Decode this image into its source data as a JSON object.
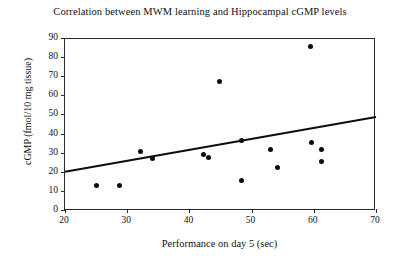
{
  "chart_data": {
    "type": "scatter",
    "title": "Correlation between MWM learning and Hippocampal cGMP levels",
    "xlabel": "Performance on day 5 (sec)",
    "ylabel": "cGMP (fmol/10 mg tissue)",
    "xlim": [
      20,
      70
    ],
    "ylim": [
      0,
      90
    ],
    "xticks": [
      20,
      30,
      40,
      50,
      60,
      70
    ],
    "yticks": [
      0,
      10,
      20,
      30,
      40,
      50,
      60,
      70,
      80,
      90
    ],
    "grid": false,
    "legend": null,
    "marker": "filled-circle",
    "marker_color": "#0d0d0d",
    "points": [
      {
        "x": 25.1,
        "y": 12.6
      },
      {
        "x": 28.8,
        "y": 12.6
      },
      {
        "x": 32.1,
        "y": 30.4
      },
      {
        "x": 34.1,
        "y": 27.2
      },
      {
        "x": 42.3,
        "y": 28.8
      },
      {
        "x": 43.1,
        "y": 27.7
      },
      {
        "x": 44.9,
        "y": 67.0
      },
      {
        "x": 48.3,
        "y": 36.6
      },
      {
        "x": 48.3,
        "y": 15.2
      },
      {
        "x": 53.1,
        "y": 31.4
      },
      {
        "x": 54.2,
        "y": 22.5
      },
      {
        "x": 59.4,
        "y": 85.3
      },
      {
        "x": 59.6,
        "y": 35.1
      },
      {
        "x": 61.3,
        "y": 31.4
      },
      {
        "x": 61.3,
        "y": 25.6
      }
    ],
    "trendline": {
      "type": "linear-fit",
      "color": "#0d0d0d",
      "x_start": 20,
      "y_start": 20.0,
      "x_end": 70,
      "y_end": 48.7
    }
  }
}
